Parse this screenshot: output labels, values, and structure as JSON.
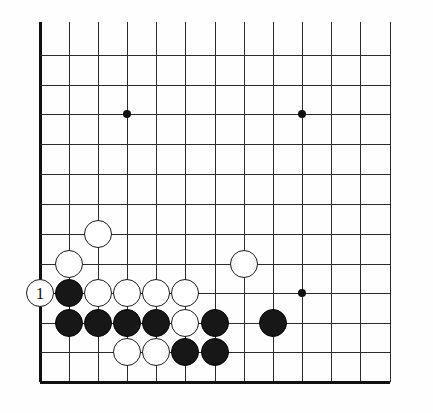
{
  "figure": {
    "type": "go-board-diagram",
    "board_size_shown": {
      "columns": 13,
      "rows": 12
    },
    "orientation": "lower-left corner",
    "edges": {
      "left": "board-edge",
      "bottom": "board-edge"
    },
    "colors": {
      "background": "#fefefe",
      "grid": "#2b2b2b",
      "edge": "#111111",
      "black_stone": "#171717",
      "white_stone": "#ffffff",
      "star_point": "#111111",
      "label_on_white": "#141414"
    }
  },
  "geometry": {
    "origin_x": 40,
    "origin_y": 55,
    "spacing_x": 29.2,
    "spacing_y": 29.7,
    "columns_x": [
      40,
      69,
      98,
      127,
      156,
      185,
      215,
      244,
      273,
      302,
      331,
      360,
      390
    ],
    "rows_y": [
      55,
      85,
      114,
      144,
      174,
      204,
      234,
      264,
      293,
      323,
      352,
      382
    ],
    "grid_top_cut_y": 22,
    "grid_right_cut_x": 390
  },
  "star_points": [
    {
      "name": "star-point-left",
      "x": 127,
      "y": 114
    },
    {
      "name": "star-point-upper-right",
      "x": 302,
      "y": 114
    },
    {
      "name": "star-point-lower-right",
      "x": 302,
      "y": 293
    }
  ],
  "stones": [
    {
      "id": "w-c3-r5",
      "color": "white",
      "x": 98,
      "y": 234,
      "label": ""
    },
    {
      "id": "w-c2-r4",
      "color": "white",
      "x": 69,
      "y": 264,
      "label": ""
    },
    {
      "id": "w-c8-r4",
      "color": "white",
      "x": 244,
      "y": 264,
      "label": ""
    },
    {
      "id": "w-c1-r3",
      "color": "white",
      "x": 40,
      "y": 293,
      "label": "1"
    },
    {
      "id": "b-c2-r3",
      "color": "black",
      "x": 69,
      "y": 293,
      "label": ""
    },
    {
      "id": "w-c3-r3",
      "color": "white",
      "x": 98,
      "y": 293,
      "label": ""
    },
    {
      "id": "w-c4-r3",
      "color": "white",
      "x": 127,
      "y": 293,
      "label": ""
    },
    {
      "id": "w-c5-r3",
      "color": "white",
      "x": 156,
      "y": 293,
      "label": ""
    },
    {
      "id": "w-c6-r3",
      "color": "white",
      "x": 185,
      "y": 293,
      "label": ""
    },
    {
      "id": "b-c2-r2",
      "color": "black",
      "x": 69,
      "y": 323,
      "label": ""
    },
    {
      "id": "b-c3-r2",
      "color": "black",
      "x": 98,
      "y": 323,
      "label": ""
    },
    {
      "id": "b-c4-r2",
      "color": "black",
      "x": 127,
      "y": 323,
      "label": ""
    },
    {
      "id": "b-c5-r2",
      "color": "black",
      "x": 156,
      "y": 323,
      "label": ""
    },
    {
      "id": "w-c6-r2",
      "color": "white",
      "x": 185,
      "y": 323,
      "label": ""
    },
    {
      "id": "b-c7-r2",
      "color": "black",
      "x": 215,
      "y": 323,
      "label": ""
    },
    {
      "id": "b-c9-r2",
      "color": "black",
      "x": 273,
      "y": 323,
      "label": ""
    },
    {
      "id": "w-c4-r1",
      "color": "white",
      "x": 127,
      "y": 352,
      "label": ""
    },
    {
      "id": "w-c5-r1",
      "color": "white",
      "x": 156,
      "y": 352,
      "label": ""
    },
    {
      "id": "b-c6-r1",
      "color": "black",
      "x": 185,
      "y": 352,
      "label": ""
    },
    {
      "id": "b-c7-r1",
      "color": "black",
      "x": 215,
      "y": 352,
      "label": ""
    }
  ],
  "move_markers": [
    {
      "number": "1",
      "color": "white",
      "x": 40,
      "y": 293
    }
  ]
}
